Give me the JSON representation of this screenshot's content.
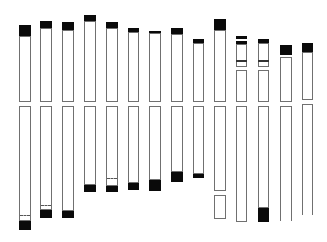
{
  "diagram": {
    "type": "chromosome-ideogram",
    "colors": {
      "background": "#ffffff",
      "outline": "#707070",
      "band": "#0a0a0a"
    },
    "centromere_gap": [
      102,
      106
    ],
    "chromosomes": [
      {
        "id": 1,
        "x": 19,
        "w": 12,
        "segments": [
          [
            36,
            102
          ],
          [
            106,
            221
          ]
        ],
        "bands": [
          [
            25,
            36
          ],
          [
            221,
            230
          ]
        ],
        "dashes": [
          215
        ],
        "lines": []
      },
      {
        "id": 2,
        "x": 40,
        "w": 12,
        "segments": [
          [
            28,
            102
          ],
          [
            106,
            210
          ]
        ],
        "bands": [
          [
            21,
            28
          ],
          [
            210,
            218
          ]
        ],
        "dashes": [
          205
        ],
        "lines": []
      },
      {
        "id": 3,
        "x": 62,
        "w": 12,
        "segments": [
          [
            30,
            102
          ],
          [
            106,
            211
          ]
        ],
        "bands": [
          [
            22,
            30
          ],
          [
            211,
            218
          ]
        ],
        "dashes": [],
        "lines": []
      },
      {
        "id": 4,
        "x": 84,
        "w": 12,
        "segments": [
          [
            21,
            102
          ],
          [
            106,
            185
          ]
        ],
        "bands": [
          [
            15,
            21
          ],
          [
            185,
            192
          ]
        ],
        "dashes": [],
        "lines": []
      },
      {
        "id": 5,
        "x": 106,
        "w": 12,
        "segments": [
          [
            28,
            102
          ],
          [
            106,
            186
          ]
        ],
        "bands": [
          [
            22,
            28
          ],
          [
            186,
            192
          ]
        ],
        "dashes": [
          178
        ],
        "lines": []
      },
      {
        "id": 6,
        "x": 128,
        "w": 11,
        "segments": [
          [
            32,
            102
          ],
          [
            106,
            183
          ]
        ],
        "bands": [
          [
            28,
            32
          ],
          [
            183,
            190
          ]
        ],
        "dashes": [],
        "lines": []
      },
      {
        "id": 7,
        "x": 149,
        "w": 12,
        "segments": [
          [
            33,
            102
          ],
          [
            106,
            180
          ]
        ],
        "bands": [
          [
            31,
            33
          ],
          [
            180,
            191
          ]
        ],
        "dashes": [],
        "lines": []
      },
      {
        "id": 8,
        "x": 171,
        "w": 12,
        "segments": [
          [
            34,
            102
          ],
          [
            106,
            172
          ]
        ],
        "bands": [
          [
            28,
            34
          ],
          [
            172,
            182
          ]
        ],
        "dashes": [],
        "lines": []
      },
      {
        "id": 9,
        "x": 193,
        "w": 11,
        "segments": [
          [
            43,
            102
          ],
          [
            106,
            174
          ]
        ],
        "bands": [
          [
            39,
            43
          ],
          [
            174,
            178
          ]
        ],
        "dashes": [],
        "lines": []
      },
      {
        "id": 10,
        "x": 214,
        "w": 12,
        "segments": [
          [
            30,
            102
          ],
          [
            106,
            191
          ],
          [
            195,
            219
          ]
        ],
        "bands": [
          [
            19,
            30
          ]
        ],
        "dashes": [],
        "lines": []
      },
      {
        "id": 11,
        "x": 236,
        "w": 11,
        "segments": [
          [
            44,
            67
          ],
          [
            70,
            102
          ],
          [
            106,
            222
          ]
        ],
        "bands": [
          [
            36,
            39
          ],
          [
            41,
            44
          ]
        ],
        "dashes": [],
        "lines": [
          60
        ]
      },
      {
        "id": 12,
        "x": 258,
        "w": 11,
        "segments": [
          [
            43,
            67
          ],
          [
            70,
            102
          ],
          [
            106,
            208
          ]
        ],
        "bands": [
          [
            39,
            43
          ],
          [
            208,
            222
          ]
        ],
        "dashes": [],
        "lines": [
          60
        ]
      },
      {
        "id": 13,
        "x": 280,
        "w": 12,
        "segments": [
          [
            57,
            102
          ],
          [
            106,
            221,
            "open"
          ]
        ],
        "bands": [
          [
            45,
            55
          ]
        ],
        "dashes": [],
        "lines": []
      },
      {
        "id": 14,
        "x": 302,
        "w": 11,
        "segments": [
          [
            52,
            100
          ],
          [
            104,
            215,
            "open"
          ]
        ],
        "bands": [
          [
            43,
            52
          ]
        ],
        "dashes": [],
        "lines": []
      }
    ]
  }
}
